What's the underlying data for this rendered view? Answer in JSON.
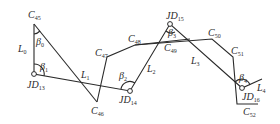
{
  "diagram": {
    "type": "route-traverse-sketch",
    "colors": {
      "line": "#2a2a2a",
      "background": "#ffffff"
    },
    "junction_points": [
      {
        "id": "JD13",
        "base": "JD",
        "sub": "13",
        "x": 34,
        "y": 74
      },
      {
        "id": "JD14",
        "base": "JD",
        "sub": "14",
        "x": 130,
        "y": 91
      },
      {
        "id": "JD15",
        "base": "JD",
        "sub": "15",
        "x": 170,
        "y": 24
      },
      {
        "id": "JD16",
        "base": "JD",
        "sub": "16",
        "x": 242,
        "y": 88
      }
    ],
    "control_points": [
      {
        "id": "C45",
        "base": "C",
        "sub": "45"
      },
      {
        "id": "C46",
        "base": "C",
        "sub": "46"
      },
      {
        "id": "C47",
        "base": "C",
        "sub": "47"
      },
      {
        "id": "C48",
        "base": "C",
        "sub": "48"
      },
      {
        "id": "C49",
        "base": "C",
        "sub": "49"
      },
      {
        "id": "C50",
        "base": "C",
        "sub": "50"
      },
      {
        "id": "C51",
        "base": "C",
        "sub": "51"
      },
      {
        "id": "C52",
        "base": "C",
        "sub": "52"
      }
    ],
    "segments": [
      {
        "id": "L0",
        "base": "L",
        "sub": "0"
      },
      {
        "id": "L1",
        "base": "L",
        "sub": "1"
      },
      {
        "id": "L2",
        "base": "L",
        "sub": "2"
      },
      {
        "id": "L3",
        "base": "L",
        "sub": "3"
      },
      {
        "id": "L4",
        "base": "L",
        "sub": "4"
      }
    ],
    "angles": [
      {
        "id": "beta0",
        "base": "β",
        "sub": "0"
      },
      {
        "id": "beta1",
        "base": "β",
        "sub": "1"
      },
      {
        "id": "beta2",
        "base": "β",
        "sub": "2"
      },
      {
        "id": "beta3",
        "base": "β",
        "sub": "3"
      },
      {
        "id": "beta4",
        "base": "β",
        "sub": "4"
      }
    ]
  }
}
